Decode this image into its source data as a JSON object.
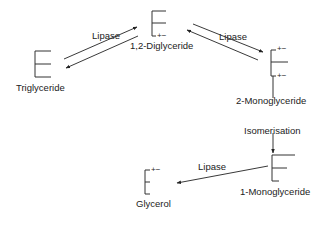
{
  "diagram": {
    "nodes": [
      {
        "id": "triglyceride",
        "label": "Triglyceride"
      },
      {
        "id": "diglyceride",
        "label": "1,2-Diglyceride"
      },
      {
        "id": "monoglyceride2",
        "label": "2-Monoglyceride"
      },
      {
        "id": "monoglyceride1",
        "label": "1-Monoglyceride"
      },
      {
        "id": "glycerol",
        "label": "Glycerol"
      }
    ],
    "edges": [
      {
        "from": "triglyceride",
        "to": "diglyceride",
        "label": "Lipase",
        "reversible": true
      },
      {
        "from": "diglyceride",
        "to": "monoglyceride2",
        "label": "Lipase",
        "reversible": true
      },
      {
        "from": "monoglyceride2",
        "to": "monoglyceride1",
        "label": "Isomerisation",
        "reversible": false
      },
      {
        "from": "monoglyceride1",
        "to": "glycerol",
        "label": "Lipase",
        "reversible": false
      }
    ],
    "charge_marker": "+−"
  }
}
